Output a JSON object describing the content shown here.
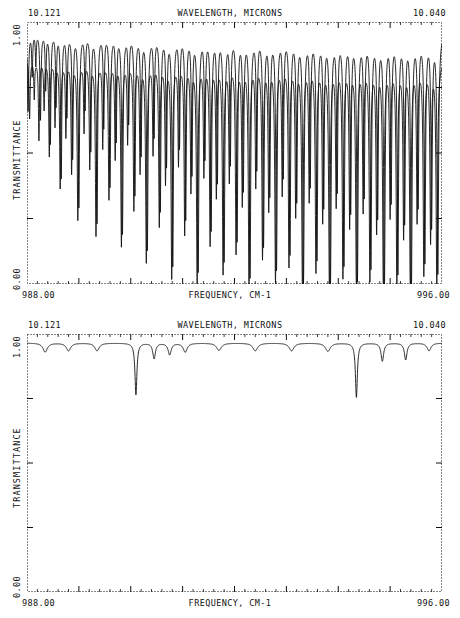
{
  "charts": [
    {
      "id": "spectrum-top",
      "header": {
        "left": "10.121",
        "center": "WAVELENGTH, MICRONS",
        "right": "10.040"
      },
      "footer": {
        "left": "988.00",
        "center": "FREQUENCY, CM-1",
        "right": "996.00"
      },
      "yaxis": {
        "title": "TRANSMITTANCE",
        "top": "1.00",
        "bottom": "0.00"
      }
    },
    {
      "id": "spectrum-bottom",
      "header": {
        "left": "10.121",
        "center": "WAVELENGTH, MICRONS",
        "right": "10.040"
      },
      "footer": {
        "left": "988.00",
        "center": "FREQUENCY, CM-1",
        "right": "996.00"
      },
      "yaxis": {
        "title": "TRANSMITTANCE",
        "top": "1.00",
        "bottom": "0.00"
      }
    }
  ],
  "chart_data": [
    {
      "type": "line",
      "title": "WAVELENGTH, MICRONS",
      "xlabel": "FREQUENCY, CM-1",
      "ylabel": "TRANSMITTANCE",
      "xlim": [
        988.0,
        996.0
      ],
      "ylim": [
        0.0,
        1.0
      ],
      "x_top_axis_label": "WAVELENGTH, MICRONS",
      "x_top_range_microns": [
        10.121,
        10.04
      ],
      "grid": false,
      "x_major_ticks": [
        988.0,
        989.0,
        990.0,
        991.0,
        992.0,
        993.0,
        994.0,
        995.0,
        996.0
      ],
      "y_major_ticks": [
        0.0,
        0.25,
        0.5,
        0.75,
        1.0
      ],
      "legend": null,
      "series": [
        {
          "name": "upper-trace",
          "baseline": 0.965,
          "lines": [
            {
              "center": 988.02,
              "depth": 0.3,
              "width": 0.028
            },
            {
              "center": 988.1,
              "depth": 0.16,
              "width": 0.022
            },
            {
              "center": 988.17,
              "depth": 0.12,
              "width": 0.02
            },
            {
              "center": 988.26,
              "depth": 0.33,
              "width": 0.026
            },
            {
              "center": 988.36,
              "depth": 0.21,
              "width": 0.022
            },
            {
              "center": 988.45,
              "depth": 0.42,
              "width": 0.026
            },
            {
              "center": 988.56,
              "depth": 0.27,
              "width": 0.022
            },
            {
              "center": 988.66,
              "depth": 0.55,
              "width": 0.028
            },
            {
              "center": 988.77,
              "depth": 0.31,
              "width": 0.024
            },
            {
              "center": 988.88,
              "depth": 0.47,
              "width": 0.026
            },
            {
              "center": 989.0,
              "depth": 0.66,
              "width": 0.03
            },
            {
              "center": 989.12,
              "depth": 0.28,
              "width": 0.022
            },
            {
              "center": 989.23,
              "depth": 0.44,
              "width": 0.026
            },
            {
              "center": 989.35,
              "depth": 0.72,
              "width": 0.03
            },
            {
              "center": 989.48,
              "depth": 0.35,
              "width": 0.024
            },
            {
              "center": 989.6,
              "depth": 0.58,
              "width": 0.028
            },
            {
              "center": 989.72,
              "depth": 0.4,
              "width": 0.024
            },
            {
              "center": 989.84,
              "depth": 0.76,
              "width": 0.03
            },
            {
              "center": 989.96,
              "depth": 0.33,
              "width": 0.024
            },
            {
              "center": 990.08,
              "depth": 0.61,
              "width": 0.028
            },
            {
              "center": 990.2,
              "depth": 0.45,
              "width": 0.026
            },
            {
              "center": 990.32,
              "depth": 0.82,
              "width": 0.032
            },
            {
              "center": 990.45,
              "depth": 0.38,
              "width": 0.024
            },
            {
              "center": 990.57,
              "depth": 0.67,
              "width": 0.028
            },
            {
              "center": 990.69,
              "depth": 0.49,
              "width": 0.026
            },
            {
              "center": 990.81,
              "depth": 0.88,
              "width": 0.032
            },
            {
              "center": 990.94,
              "depth": 0.42,
              "width": 0.024
            },
            {
              "center": 991.06,
              "depth": 0.7,
              "width": 0.028
            },
            {
              "center": 991.18,
              "depth": 0.52,
              "width": 0.026
            },
            {
              "center": 991.3,
              "depth": 0.9,
              "width": 0.032
            },
            {
              "center": 991.43,
              "depth": 0.46,
              "width": 0.026
            },
            {
              "center": 991.55,
              "depth": 0.74,
              "width": 0.03
            },
            {
              "center": 991.67,
              "depth": 0.55,
              "width": 0.026
            },
            {
              "center": 991.8,
              "depth": 0.86,
              "width": 0.032
            },
            {
              "center": 991.92,
              "depth": 0.48,
              "width": 0.026
            },
            {
              "center": 992.05,
              "depth": 0.78,
              "width": 0.03
            },
            {
              "center": 992.17,
              "depth": 0.58,
              "width": 0.028
            },
            {
              "center": 992.3,
              "depth": 0.92,
              "width": 0.032
            },
            {
              "center": 992.43,
              "depth": 0.5,
              "width": 0.026
            },
            {
              "center": 992.56,
              "depth": 0.8,
              "width": 0.03
            },
            {
              "center": 992.68,
              "depth": 0.6,
              "width": 0.028
            },
            {
              "center": 992.81,
              "depth": 0.89,
              "width": 0.032
            },
            {
              "center": 992.94,
              "depth": 0.53,
              "width": 0.026
            },
            {
              "center": 993.07,
              "depth": 0.83,
              "width": 0.03
            },
            {
              "center": 993.2,
              "depth": 0.62,
              "width": 0.028
            },
            {
              "center": 993.33,
              "depth": 0.94,
              "width": 0.034
            },
            {
              "center": 993.46,
              "depth": 0.56,
              "width": 0.026
            },
            {
              "center": 993.59,
              "depth": 0.85,
              "width": 0.032
            },
            {
              "center": 993.72,
              "depth": 0.64,
              "width": 0.028
            },
            {
              "center": 993.85,
              "depth": 0.95,
              "width": 0.034
            },
            {
              "center": 993.98,
              "depth": 0.58,
              "width": 0.028
            },
            {
              "center": 994.11,
              "depth": 0.87,
              "width": 0.032
            },
            {
              "center": 994.24,
              "depth": 0.66,
              "width": 0.028
            },
            {
              "center": 994.37,
              "depth": 0.93,
              "width": 0.034
            },
            {
              "center": 994.5,
              "depth": 0.6,
              "width": 0.028
            },
            {
              "center": 994.63,
              "depth": 0.88,
              "width": 0.032
            },
            {
              "center": 994.76,
              "depth": 0.68,
              "width": 0.03
            },
            {
              "center": 994.89,
              "depth": 0.96,
              "width": 0.034
            },
            {
              "center": 995.02,
              "depth": 0.62,
              "width": 0.028
            },
            {
              "center": 995.15,
              "depth": 0.9,
              "width": 0.032
            },
            {
              "center": 995.28,
              "depth": 0.7,
              "width": 0.03
            },
            {
              "center": 995.41,
              "depth": 0.97,
              "width": 0.034
            },
            {
              "center": 995.54,
              "depth": 0.64,
              "width": 0.028
            },
            {
              "center": 995.67,
              "depth": 0.86,
              "width": 0.032
            },
            {
              "center": 995.8,
              "depth": 0.72,
              "width": 0.03
            },
            {
              "center": 995.92,
              "depth": 0.91,
              "width": 0.034
            }
          ]
        },
        {
          "name": "lower-trace",
          "baseline": 0.855,
          "lines": [
            {
              "center": 988.05,
              "depth": 0.22,
              "width": 0.024
            },
            {
              "center": 988.14,
              "depth": 0.14,
              "width": 0.02
            },
            {
              "center": 988.23,
              "depth": 0.3,
              "width": 0.024
            },
            {
              "center": 988.33,
              "depth": 0.18,
              "width": 0.022
            },
            {
              "center": 988.43,
              "depth": 0.36,
              "width": 0.026
            },
            {
              "center": 988.54,
              "depth": 0.24,
              "width": 0.022
            },
            {
              "center": 988.64,
              "depth": 0.48,
              "width": 0.028
            },
            {
              "center": 988.75,
              "depth": 0.28,
              "width": 0.024
            },
            {
              "center": 988.86,
              "depth": 0.42,
              "width": 0.026
            },
            {
              "center": 988.98,
              "depth": 0.6,
              "width": 0.03
            },
            {
              "center": 989.1,
              "depth": 0.26,
              "width": 0.022
            },
            {
              "center": 989.21,
              "depth": 0.4,
              "width": 0.026
            },
            {
              "center": 989.33,
              "depth": 0.66,
              "width": 0.03
            },
            {
              "center": 989.46,
              "depth": 0.32,
              "width": 0.024
            },
            {
              "center": 989.58,
              "depth": 0.52,
              "width": 0.028
            },
            {
              "center": 989.7,
              "depth": 0.36,
              "width": 0.024
            },
            {
              "center": 989.82,
              "depth": 0.7,
              "width": 0.03
            },
            {
              "center": 989.94,
              "depth": 0.3,
              "width": 0.024
            },
            {
              "center": 990.06,
              "depth": 0.56,
              "width": 0.028
            },
            {
              "center": 990.18,
              "depth": 0.41,
              "width": 0.026
            },
            {
              "center": 990.3,
              "depth": 0.76,
              "width": 0.032
            },
            {
              "center": 990.43,
              "depth": 0.34,
              "width": 0.024
            },
            {
              "center": 990.55,
              "depth": 0.62,
              "width": 0.028
            },
            {
              "center": 990.67,
              "depth": 0.45,
              "width": 0.026
            },
            {
              "center": 990.79,
              "depth": 0.82,
              "width": 0.032
            },
            {
              "center": 990.92,
              "depth": 0.38,
              "width": 0.024
            },
            {
              "center": 991.04,
              "depth": 0.65,
              "width": 0.028
            },
            {
              "center": 991.16,
              "depth": 0.48,
              "width": 0.026
            },
            {
              "center": 991.28,
              "depth": 0.84,
              "width": 0.032
            },
            {
              "center": 991.41,
              "depth": 0.42,
              "width": 0.026
            },
            {
              "center": 991.53,
              "depth": 0.69,
              "width": 0.03
            },
            {
              "center": 991.65,
              "depth": 0.5,
              "width": 0.026
            },
            {
              "center": 991.78,
              "depth": 0.8,
              "width": 0.032
            },
            {
              "center": 991.9,
              "depth": 0.44,
              "width": 0.026
            },
            {
              "center": 992.03,
              "depth": 0.72,
              "width": 0.03
            },
            {
              "center": 992.15,
              "depth": 0.53,
              "width": 0.028
            },
            {
              "center": 992.28,
              "depth": 0.86,
              "width": 0.032
            },
            {
              "center": 992.41,
              "depth": 0.46,
              "width": 0.026
            },
            {
              "center": 992.54,
              "depth": 0.74,
              "width": 0.03
            },
            {
              "center": 992.66,
              "depth": 0.55,
              "width": 0.028
            },
            {
              "center": 992.79,
              "depth": 0.83,
              "width": 0.032
            },
            {
              "center": 992.92,
              "depth": 0.49,
              "width": 0.026
            },
            {
              "center": 993.05,
              "depth": 0.77,
              "width": 0.03
            },
            {
              "center": 993.18,
              "depth": 0.57,
              "width": 0.028
            },
            {
              "center": 993.31,
              "depth": 0.88,
              "width": 0.034
            },
            {
              "center": 993.44,
              "depth": 0.51,
              "width": 0.026
            },
            {
              "center": 993.57,
              "depth": 0.79,
              "width": 0.032
            },
            {
              "center": 993.7,
              "depth": 0.59,
              "width": 0.028
            },
            {
              "center": 993.83,
              "depth": 0.89,
              "width": 0.034
            },
            {
              "center": 993.96,
              "depth": 0.53,
              "width": 0.028
            },
            {
              "center": 994.09,
              "depth": 0.81,
              "width": 0.032
            },
            {
              "center": 994.22,
              "depth": 0.61,
              "width": 0.028
            },
            {
              "center": 994.35,
              "depth": 0.87,
              "width": 0.034
            },
            {
              "center": 994.48,
              "depth": 0.55,
              "width": 0.028
            },
            {
              "center": 994.61,
              "depth": 0.82,
              "width": 0.032
            },
            {
              "center": 994.74,
              "depth": 0.63,
              "width": 0.03
            },
            {
              "center": 994.87,
              "depth": 0.9,
              "width": 0.034
            },
            {
              "center": 995.0,
              "depth": 0.57,
              "width": 0.028
            },
            {
              "center": 995.13,
              "depth": 0.84,
              "width": 0.032
            },
            {
              "center": 995.26,
              "depth": 0.65,
              "width": 0.03
            },
            {
              "center": 995.39,
              "depth": 0.91,
              "width": 0.034
            },
            {
              "center": 995.52,
              "depth": 0.59,
              "width": 0.028
            },
            {
              "center": 995.65,
              "depth": 0.8,
              "width": 0.032
            },
            {
              "center": 995.78,
              "depth": 0.67,
              "width": 0.03
            },
            {
              "center": 995.9,
              "depth": 0.85,
              "width": 0.034
            }
          ]
        }
      ]
    },
    {
      "type": "line",
      "title": "WAVELENGTH, MICRONS",
      "xlabel": "FREQUENCY, CM-1",
      "ylabel": "TRANSMITTANCE",
      "xlim": [
        988.0,
        996.0
      ],
      "ylim": [
        0.0,
        1.0
      ],
      "x_top_axis_label": "WAVELENGTH, MICRONS",
      "x_top_range_microns": [
        10.121,
        10.04
      ],
      "grid": false,
      "x_major_ticks": [
        988.0,
        989.0,
        990.0,
        991.0,
        992.0,
        993.0,
        994.0,
        995.0,
        996.0
      ],
      "y_major_ticks": [
        0.0,
        0.25,
        0.5,
        0.75,
        1.0
      ],
      "legend": null,
      "series": [
        {
          "name": "reference-trace",
          "baseline": 0.965,
          "lines": [
            {
              "center": 988.35,
              "depth": 0.035,
              "width": 0.1
            },
            {
              "center": 988.8,
              "depth": 0.03,
              "width": 0.1
            },
            {
              "center": 989.35,
              "depth": 0.03,
              "width": 0.1
            },
            {
              "center": 990.1,
              "depth": 0.2,
              "width": 0.045
            },
            {
              "center": 990.45,
              "depth": 0.06,
              "width": 0.06
            },
            {
              "center": 990.75,
              "depth": 0.045,
              "width": 0.07
            },
            {
              "center": 991.05,
              "depth": 0.035,
              "width": 0.09
            },
            {
              "center": 991.7,
              "depth": 0.028,
              "width": 0.11
            },
            {
              "center": 992.4,
              "depth": 0.03,
              "width": 0.11
            },
            {
              "center": 993.1,
              "depth": 0.03,
              "width": 0.11
            },
            {
              "center": 993.8,
              "depth": 0.032,
              "width": 0.11
            },
            {
              "center": 994.35,
              "depth": 0.21,
              "width": 0.045
            },
            {
              "center": 994.85,
              "depth": 0.07,
              "width": 0.06
            },
            {
              "center": 995.3,
              "depth": 0.065,
              "width": 0.06
            },
            {
              "center": 995.75,
              "depth": 0.03,
              "width": 0.09
            }
          ]
        }
      ]
    }
  ]
}
